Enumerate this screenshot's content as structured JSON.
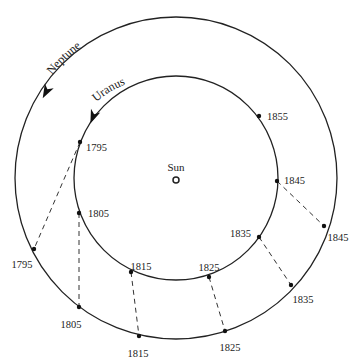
{
  "diagram": {
    "center": {
      "x": 176,
      "y": 178
    },
    "sun": {
      "label": "Sun",
      "x": 176,
      "y": 180,
      "label_x": 176,
      "label_y": 171
    },
    "orbits": [
      {
        "name": "Uranus",
        "label": "Uranus",
        "radius": 102
      },
      {
        "name": "Neptune",
        "label": "Neptune",
        "radius": 161
      }
    ],
    "line_color": "#222222",
    "uranus_positions": [
      {
        "year": "1795",
        "x": 80,
        "y": 142,
        "lx": 86,
        "ly": 147,
        "anchor": "start"
      },
      {
        "year": "1805",
        "x": 79,
        "y": 213,
        "lx": 88,
        "ly": 213,
        "anchor": "start"
      },
      {
        "year": "1815",
        "x": 131,
        "y": 272,
        "lx": 141,
        "ly": 266,
        "anchor": "middle"
      },
      {
        "year": "1825",
        "x": 209,
        "y": 277,
        "lx": 209,
        "ly": 267,
        "anchor": "middle"
      },
      {
        "year": "1835",
        "x": 259,
        "y": 237,
        "lx": 251,
        "ly": 233,
        "anchor": "end"
      },
      {
        "year": "1845",
        "x": 277,
        "y": 181,
        "lx": 284,
        "ly": 180,
        "anchor": "start"
      },
      {
        "year": "1855",
        "x": 259,
        "y": 116,
        "lx": 267,
        "ly": 116,
        "anchor": "start"
      }
    ],
    "neptune_positions": [
      {
        "year": "1795",
        "x": 34,
        "y": 249,
        "lx": 22,
        "ly": 264,
        "anchor": "middle"
      },
      {
        "year": "1805",
        "x": 79,
        "y": 307,
        "lx": 71,
        "ly": 324,
        "anchor": "middle"
      },
      {
        "year": "1815",
        "x": 139,
        "y": 336,
        "lx": 138,
        "ly": 353,
        "anchor": "middle"
      },
      {
        "year": "1825",
        "x": 225,
        "y": 331,
        "lx": 230,
        "ly": 347,
        "anchor": "middle"
      },
      {
        "year": "1835",
        "x": 291,
        "y": 285,
        "lx": 303,
        "ly": 299,
        "anchor": "middle"
      },
      {
        "year": "1845",
        "x": 324,
        "y": 226,
        "lx": 338,
        "ly": 237,
        "anchor": "middle"
      }
    ],
    "connections": [
      {
        "from": "1795",
        "ux": 80,
        "uy": 142,
        "nx": 34,
        "ny": 249
      },
      {
        "from": "1805",
        "ux": 79,
        "uy": 213,
        "nx": 79,
        "ny": 307
      },
      {
        "from": "1815",
        "ux": 131,
        "uy": 272,
        "nx": 139,
        "ny": 336
      },
      {
        "from": "1825",
        "ux": 209,
        "uy": 277,
        "nx": 225,
        "ny": 331
      },
      {
        "from": "1835",
        "ux": 259,
        "uy": 237,
        "nx": 291,
        "ny": 285
      },
      {
        "from": "1845",
        "ux": 277,
        "uy": 181,
        "nx": 324,
        "ny": 226
      }
    ],
    "arrows": [
      {
        "orbit": "Neptune",
        "x": 46,
        "y": 92,
        "angle": 118
      },
      {
        "orbit": "Uranus",
        "x": 93,
        "y": 117,
        "angle": 112
      }
    ]
  }
}
